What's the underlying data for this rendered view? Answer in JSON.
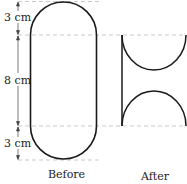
{
  "dimensions": {
    "top_cap": "3 cm",
    "middle": "8 cm",
    "bottom_cap": "3 cm"
  },
  "captions": {
    "before": "Before",
    "after": "After"
  },
  "colors": {
    "stroke": "#1a1a1a",
    "dashed": "#bbbbbb",
    "text": "#222222"
  }
}
